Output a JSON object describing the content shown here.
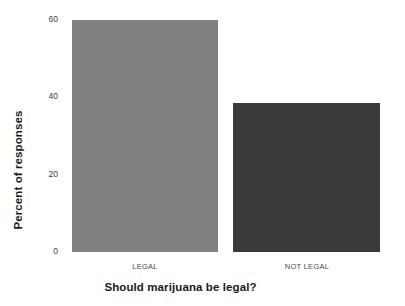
{
  "chart_data": {
    "type": "bar",
    "title": "",
    "subtitle": "",
    "xlabel": "Should marijuana be legal?",
    "ylabel": "Percent of responses",
    "categories": [
      "LEGAL",
      "NOT LEGAL"
    ],
    "values": [
      61,
      39
    ],
    "ylim": [
      0,
      63
    ],
    "yticks": [
      0,
      20,
      40,
      60
    ],
    "ytick_labels": [
      "0",
      "20",
      "40",
      "60"
    ],
    "xtick_labels": [
      "LEGAL",
      "NOT LEGAL"
    ],
    "grid": false,
    "legend": "none",
    "bar_colors": [
      "#808080",
      "#3a3a3a"
    ],
    "background_color": "#ffffff",
    "series": [
      {
        "name": "Percent of responses",
        "values": [
          61,
          39
        ]
      }
    ],
    "annotations": []
  }
}
